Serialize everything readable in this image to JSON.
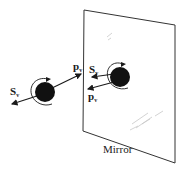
{
  "diagram": {
    "type": "physics-illustration",
    "caption": "Mirror",
    "labels": {
      "particle_spin": {
        "base": "S",
        "sub": "v"
      },
      "particle_momentum": {
        "base": "p",
        "sub": "v"
      },
      "image_spin": {
        "base": "S",
        "sub": "v"
      },
      "image_momentum": {
        "base": "p",
        "sub": "v"
      }
    },
    "colors": {
      "ink": "#1a1a1a",
      "ball": "#111111",
      "background": "#ffffff",
      "mirror_outline": "#333333",
      "streak": "#c8c8c8"
    }
  }
}
